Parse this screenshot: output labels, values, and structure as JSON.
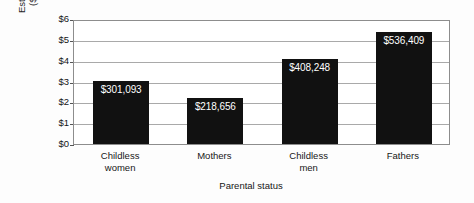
{
  "chart_data": {
    "type": "bar",
    "title": "",
    "xlabel": "Parental status",
    "ylabel": "Estimated pay ($000,000)",
    "ylabel_line1": "Estimated pay",
    "ylabel_line2": "($000,000)",
    "categories": [
      "Childless women",
      "Mothers",
      "Childless men",
      "Fathers"
    ],
    "category_lines": [
      [
        "Childless",
        "women"
      ],
      [
        "Mothers",
        ""
      ],
      [
        "Childless",
        "men"
      ],
      [
        "Fathers",
        ""
      ]
    ],
    "values": [
      3.01093,
      2.18656,
      4.08248,
      5.36409
    ],
    "data_labels": [
      "$301,093",
      "$218,656",
      "$408,248",
      "$536,409"
    ],
    "ytick_labels": [
      "$0",
      "$1",
      "$2",
      "$3",
      "$4",
      "$5",
      "$6"
    ],
    "ytick_values": [
      0,
      1,
      2,
      3,
      4,
      5,
      6
    ],
    "ylim": [
      0,
      6
    ],
    "grid": true,
    "legend": "none",
    "bar_color": "#111111",
    "label_color": "#ffffff",
    "axis_color": "#8d8d8d",
    "grid_color": "#a9a9a9"
  }
}
